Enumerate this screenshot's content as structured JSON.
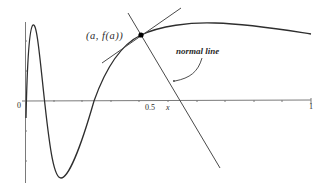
{
  "figure": {
    "point_label": "(a, f(a))",
    "annotation": "normal line",
    "axis": {
      "x_label": "x",
      "origin_label": "0",
      "x_ticks": [
        {
          "value": 0.5,
          "label": "0.5"
        },
        {
          "value": 1,
          "label": "1"
        }
      ]
    },
    "colors": {
      "curve": "#2e2e2e",
      "axis": "#6a6a6a",
      "lines": "#4a4a4a",
      "point": "#000000"
    }
  }
}
